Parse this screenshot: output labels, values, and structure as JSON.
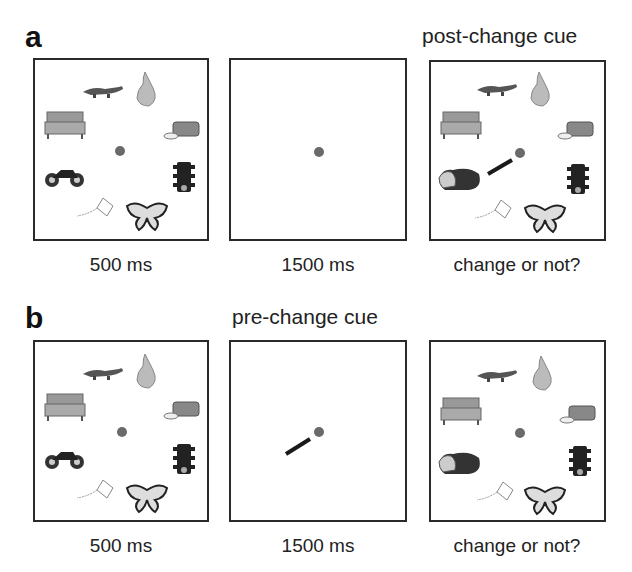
{
  "panels": [
    {
      "letter": "a",
      "cue_title": "post-change cue",
      "frames": [
        {
          "caption": "500 ms",
          "content": "memory-array",
          "items": [
            "alligator",
            "pear",
            "sofa",
            "bread",
            "motorcycle",
            "traffic-light",
            "kite",
            "butterfly"
          ]
        },
        {
          "caption": "1500 ms",
          "content": "fixation-only"
        },
        {
          "caption": "change or not?",
          "content": "test-array-with-cue",
          "items": [
            "alligator",
            "pear",
            "sofa",
            "bread",
            "frog",
            "traffic-light",
            "kite",
            "butterfly"
          ],
          "cue": "line pointing to frog location"
        }
      ]
    },
    {
      "letter": "b",
      "cue_title": "pre-change cue",
      "frames": [
        {
          "caption": "500 ms",
          "content": "memory-array",
          "items": [
            "alligator",
            "pear",
            "sofa",
            "bread",
            "motorcycle",
            "traffic-light",
            "kite",
            "butterfly"
          ]
        },
        {
          "caption": "1500 ms",
          "content": "fixation-with-cue",
          "cue": "line pointing to lower-left location"
        },
        {
          "caption": "change or not?",
          "content": "test-array",
          "items": [
            "alligator",
            "pear",
            "sofa",
            "bread",
            "frog",
            "traffic-light",
            "kite",
            "butterfly"
          ]
        }
      ]
    }
  ],
  "colors": {
    "frame_border": "#2a2a2a",
    "fixation_dot": "#6a6a6a",
    "cue_line": "#1a1a1a"
  }
}
